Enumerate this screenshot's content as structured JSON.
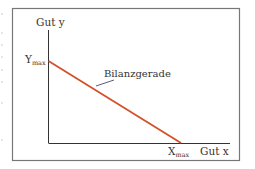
{
  "diagram": {
    "y_axis_label": "Gut y",
    "x_axis_label": "Gut x",
    "y_intercept_label": "Y",
    "y_intercept_sub": "max",
    "x_intercept_label": "X",
    "x_intercept_sub": "max",
    "line_label": "Bilanzgerade",
    "colors": {
      "budget_line": "#d4502a",
      "axes": "#333333",
      "frame": "#777777"
    }
  }
}
